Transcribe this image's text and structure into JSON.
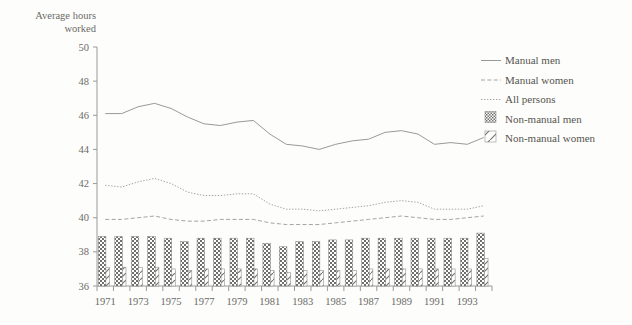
{
  "chart_data": {
    "type": "bar",
    "title": "",
    "ylabel_line1": "Average hours",
    "ylabel_line2": "worked",
    "xlabel": "",
    "ylim": [
      36,
      50
    ],
    "yticks": [
      36,
      38,
      40,
      42,
      44,
      46,
      48,
      50
    ],
    "grid": false,
    "legend_position": "right",
    "x": [
      1971,
      1972,
      1973,
      1974,
      1975,
      1976,
      1977,
      1978,
      1979,
      1980,
      1981,
      1982,
      1983,
      1984,
      1985,
      1986,
      1987,
      1988,
      1989,
      1990,
      1991,
      1992,
      1993,
      1994
    ],
    "xticklabels": [
      "1971",
      "",
      "1973",
      "",
      "1975",
      "",
      "1977",
      "",
      "1979",
      "",
      "1981",
      "",
      "1983",
      "",
      "1985",
      "",
      "1987",
      "",
      "1989",
      "",
      "1991",
      "",
      "1993",
      ""
    ],
    "series": [
      {
        "name": "Manual men",
        "style": "solid-line",
        "color": "#8d8d8a",
        "values": [
          46.1,
          46.1,
          46.5,
          46.7,
          46.4,
          45.9,
          45.5,
          45.4,
          45.6,
          45.7,
          44.9,
          44.3,
          44.2,
          44.0,
          44.3,
          44.5,
          44.6,
          45.0,
          45.1,
          44.9,
          44.3,
          44.4,
          44.3,
          44.7
        ]
      },
      {
        "name": "Manual women",
        "style": "dashed-line",
        "color": "#9a9a96",
        "values": [
          39.9,
          39.9,
          40.0,
          40.1,
          39.9,
          39.8,
          39.8,
          39.9,
          39.9,
          39.9,
          39.7,
          39.6,
          39.6,
          39.6,
          39.7,
          39.8,
          39.9,
          40.0,
          40.1,
          40.0,
          39.9,
          39.9,
          40.0,
          40.1
        ]
      },
      {
        "name": "All persons",
        "style": "dotted-line",
        "color": "#9a9a96",
        "values": [
          41.9,
          41.8,
          42.1,
          42.3,
          42.0,
          41.5,
          41.3,
          41.3,
          41.4,
          41.4,
          40.8,
          40.5,
          40.5,
          40.4,
          40.5,
          40.6,
          40.7,
          40.9,
          41.0,
          40.9,
          40.5,
          40.5,
          40.5,
          40.7
        ]
      },
      {
        "name": "Non-manual men",
        "style": "bar-crosshatch",
        "color": "#7d7d79",
        "values": [
          38.9,
          38.9,
          38.9,
          38.9,
          38.8,
          38.6,
          38.8,
          38.8,
          38.8,
          38.8,
          38.5,
          38.3,
          38.6,
          38.6,
          38.7,
          38.7,
          38.8,
          38.8,
          38.8,
          38.8,
          38.8,
          38.8,
          38.8,
          39.1
        ]
      },
      {
        "name": "Non-manual women",
        "style": "bar-diagonal",
        "color": "#8a8a86",
        "values": [
          37.1,
          37.1,
          37.1,
          37.1,
          37.0,
          36.9,
          37.0,
          37.0,
          37.0,
          37.0,
          36.9,
          36.8,
          36.9,
          36.9,
          36.9,
          36.9,
          37.0,
          37.0,
          37.0,
          37.0,
          37.0,
          37.0,
          37.0,
          37.6
        ]
      }
    ]
  },
  "legend": {
    "items": [
      {
        "label": "Manual men",
        "swatch": "solid-line-swatch"
      },
      {
        "label": "Manual women",
        "swatch": "dashed-line-swatch"
      },
      {
        "label": "All persons",
        "swatch": "dotted-line-swatch"
      },
      {
        "label": "Non-manual men",
        "swatch": "crosshatch-swatch"
      },
      {
        "label": "Non-manual women",
        "swatch": "diagonal-swatch"
      }
    ]
  },
  "colors": {
    "background": "#fdfdfb",
    "axis": "#9a9a97",
    "text": "#5a5a58"
  }
}
